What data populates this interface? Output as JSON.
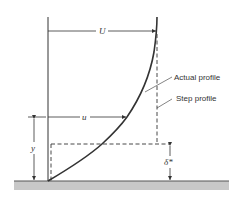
{
  "diagram": {
    "labels": {
      "free_stream_velocity": "U",
      "local_velocity": "u",
      "height": "y",
      "displacement_thickness": "δ*",
      "actual_profile": "Actual profile",
      "step_profile": "Step profile"
    },
    "colors": {
      "line": "#333333",
      "ground": "#c8c8c8",
      "ground_edge": "#555555"
    }
  }
}
